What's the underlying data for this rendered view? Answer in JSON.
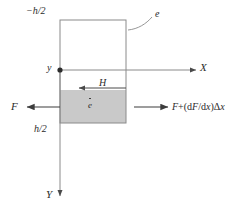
{
  "figure": {
    "colors": {
      "line": "#8a8a8a",
      "box_stroke": "#8a8a8a",
      "shaded_fill": "#c9c9c9",
      "text": "#2b2b2b",
      "background": "#ffffff"
    }
  },
  "labels": {
    "top_coordinate": "−h/2",
    "bottom_coordinate": "h/2",
    "element_callout": "e",
    "y_point": "y",
    "x_axis": "X",
    "y_axis": "Y",
    "shear_arrow": "H",
    "strain_rate": "e",
    "force_left": "F",
    "force_right_prefix": "F",
    "force_right_plus": "+",
    "force_right_open": "(d",
    "force_right_var1": "F",
    "force_right_slash": "/d",
    "force_right_var2": "x",
    "force_right_close": ")",
    "force_right_delta": "Δ",
    "force_right_var3": "x",
    "force_right_full": "F + (dF/dx)Δx"
  },
  "geometry": {
    "box_left": 60,
    "box_right": 126,
    "box_top": 20,
    "box_bottom": 123,
    "neutral_axis_y": 70,
    "shaded_top": 90,
    "x_axis_end": 196,
    "y_axis_end": 196
  }
}
